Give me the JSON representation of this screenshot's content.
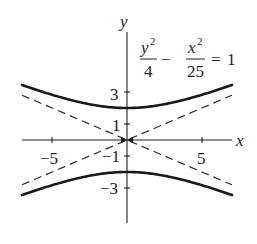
{
  "chart_data": {
    "type": "line",
    "title": "",
    "equation": {
      "lhs_term1_num": "y",
      "lhs_term1_num_exp": "2",
      "lhs_term1_den": "4",
      "operator": "−",
      "lhs_term2_num": "x",
      "lhs_term2_num_exp": "2",
      "lhs_term2_den": "25",
      "equals": "=",
      "rhs": "1"
    },
    "xlabel": "x",
    "ylabel": "y",
    "xlim": [
      -7,
      7
    ],
    "ylim": [
      -5.3,
      6.8
    ],
    "x_ticks": [
      -5,
      5
    ],
    "x_tick_labels": [
      "−5",
      "5"
    ],
    "y_ticks": [
      -3,
      -1,
      1,
      3
    ],
    "y_tick_labels": [
      "−3",
      "−1",
      "1",
      "3"
    ],
    "y_ticks_unlabeled": [
      -2,
      2
    ],
    "grid": false,
    "legend": null,
    "series": [
      {
        "name": "hyperbola upper branch",
        "style": "solid-thick",
        "formula": "y = 2*sqrt(1 + x^2/25)",
        "x": [
          -7,
          -5,
          -3,
          0,
          3,
          5,
          7
        ],
        "y": [
          3.44,
          2.83,
          2.33,
          2.0,
          2.33,
          2.83,
          3.44
        ]
      },
      {
        "name": "hyperbola lower branch",
        "style": "solid-thick",
        "formula": "y = -2*sqrt(1 + x^2/25)",
        "x": [
          -7,
          -5,
          -3,
          0,
          3,
          5,
          7
        ],
        "y": [
          -3.44,
          -2.83,
          -2.33,
          -2.0,
          -2.33,
          -2.83,
          -3.44
        ]
      },
      {
        "name": "asymptote y = (2/5)x",
        "style": "dashed",
        "formula": "y = 0.4x",
        "x": [
          -7,
          7
        ],
        "y": [
          -2.8,
          2.8
        ]
      },
      {
        "name": "asymptote y = -(2/5)x",
        "style": "dashed",
        "formula": "y = -0.4x",
        "x": [
          -7,
          7
        ],
        "y": [
          2.8,
          -2.8
        ]
      }
    ],
    "vertices": [
      [
        0,
        2
      ],
      [
        0,
        -2
      ]
    ],
    "a": 5,
    "b": 2
  },
  "layout": {
    "origin_px": [
      127,
      140
    ],
    "x_scale_px": 15,
    "y_scale_px": 16,
    "x_axis_px": [
      22,
      232
    ],
    "y_axis_px": [
      32,
      223
    ]
  },
  "colors": {
    "ink": "#231f20",
    "curve": "#1a1a1a",
    "background": "#ffffff"
  }
}
